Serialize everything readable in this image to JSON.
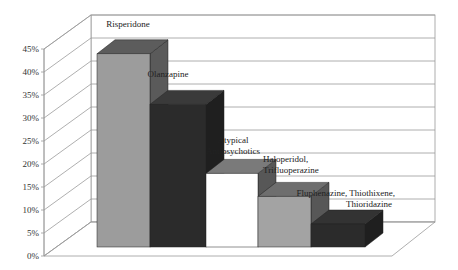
{
  "chart_data": {
    "type": "bar",
    "style": "3d-column",
    "title": "",
    "xlabel": "",
    "ylabel": "",
    "categories": [
      "Risperidone",
      "Olanzapine",
      "Atypical Antipsychotics",
      "Haloperidol, Trifluoperazine",
      "Fluphenazine, Thiothixene, Thioridazine"
    ],
    "values": [
      42,
      31,
      16,
      11,
      5
    ],
    "value_unit": "%",
    "ylim": [
      0,
      45
    ],
    "yticks": [
      "0%",
      "5%",
      "10%",
      "15%",
      "20%",
      "25%",
      "30%",
      "35%",
      "40%",
      "45%"
    ],
    "grid": true,
    "legend": "none",
    "data_labels": [
      [
        "Risperidone"
      ],
      [
        "Olanzapine"
      ],
      [
        "Atypical",
        "Antipsychotics"
      ],
      [
        "Haloperidol,",
        "Trifluoperazine"
      ],
      [
        "Fluphenazine, Thiothixene,",
        "Thioridazine"
      ]
    ],
    "colors": {
      "front": [
        "#9c9c9c",
        "#2b2b2b",
        "#ffffff",
        "#a3a3a3",
        "#2b2b2b"
      ],
      "top": [
        "#5c5c5c",
        "#3a3a3a",
        "#7a7a7a",
        "#6e6e6e",
        "#333333"
      ],
      "side": [
        "#5a5a5a",
        "#1f1f1f",
        "#575757",
        "#575757",
        "#1f1f1f"
      ]
    }
  }
}
